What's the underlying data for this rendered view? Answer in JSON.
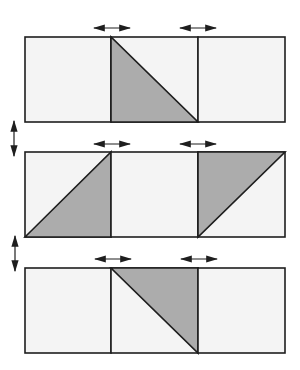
{
  "diagram": {
    "title": "",
    "colors": {
      "background": "#ffffff",
      "cell_fill": "#f4f4f4",
      "shaded_fill": "#acacac",
      "stroke": "#1e1e1e",
      "arrow": "#1e1e1e"
    },
    "layout": {
      "left": 25,
      "divider1": 111,
      "divider2": 198,
      "right": 285,
      "rows_y": [
        [
          37,
          122
        ],
        [
          152,
          237
        ],
        [
          268,
          353
        ]
      ]
    },
    "rows": [
      {
        "index": 1,
        "cells": [
          {
            "shade": "none"
          },
          {
            "shade": "lower-left",
            "diagonal": "top-left to bottom-right"
          },
          {
            "shade": "none"
          }
        ]
      },
      {
        "index": 2,
        "cells": [
          {
            "shade": "lower-right",
            "diagonal": "bottom-left to top-right"
          },
          {
            "shade": "none"
          },
          {
            "shade": "upper-left",
            "diagonal": "bottom-left to top-right"
          }
        ]
      },
      {
        "index": 3,
        "cells": [
          {
            "shade": "none"
          },
          {
            "shade": "upper-right",
            "diagonal": "top-left to bottom-right"
          },
          {
            "shade": "none"
          }
        ]
      }
    ],
    "arrows": {
      "horizontal": "double-headed horizontal arrows above each vertical seam (swap adjacent squares)",
      "vertical": "double-headed vertical arrows at left between rows (swap rows)"
    }
  }
}
